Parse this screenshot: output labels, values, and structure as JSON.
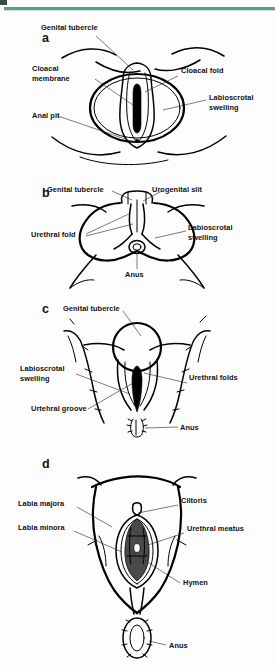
{
  "figure": {
    "accent_color": "#5a9e84",
    "ink_color": "#000000",
    "background_color": "#ffffff"
  },
  "panels": [
    {
      "letter": "a",
      "name": "indifferent-stage-cloacal",
      "labels": [
        {
          "key": "genital_tubercle",
          "text": "Genital tubercle"
        },
        {
          "key": "cloacal_membrane_l1",
          "text": "Cloacal"
        },
        {
          "key": "cloacal_membrane_l2",
          "text": "membrane"
        },
        {
          "key": "anal_pit",
          "text": "Anal pit"
        },
        {
          "key": "cloacal_fold",
          "text": "Cloacal fold"
        },
        {
          "key": "labioscrotal_swelling_l1",
          "text": "Labioscrotal"
        },
        {
          "key": "labioscrotal_swelling_l2",
          "text": "swelling"
        }
      ]
    },
    {
      "letter": "b",
      "name": "indifferent-stage-urogenital",
      "labels": [
        {
          "key": "genital_tubercle",
          "text": "Genital tubercle"
        },
        {
          "key": "urogenital_slit",
          "text": "Urogenital slit"
        },
        {
          "key": "urethral_fold",
          "text": "Urethral fold"
        },
        {
          "key": "labioscrotal_swelling_l1",
          "text": "Labioscrotal"
        },
        {
          "key": "labioscrotal_swelling_l2",
          "text": "swelling"
        },
        {
          "key": "anus",
          "text": "Anus"
        }
      ]
    },
    {
      "letter": "c",
      "name": "developing-female-genitalia",
      "labels": [
        {
          "key": "genital_tubercle",
          "text": "Genital tubercle"
        },
        {
          "key": "labioscrotal_swelling_l1",
          "text": "Labioscrotal"
        },
        {
          "key": "labioscrotal_swelling_l2",
          "text": "swelling"
        },
        {
          "key": "urethral_groove",
          "text": "Urtehral groove"
        },
        {
          "key": "urethral_folds",
          "text": "Urethral folds"
        },
        {
          "key": "anus",
          "text": "Anus"
        }
      ]
    },
    {
      "letter": "d",
      "name": "mature-female-external-genitalia",
      "labels": [
        {
          "key": "labia_majora",
          "text": "Labia majora"
        },
        {
          "key": "labia_minora",
          "text": "Labia minora"
        },
        {
          "key": "clitoris",
          "text": "Clitoris"
        },
        {
          "key": "urethral_meatus",
          "text": "Urethral meatus"
        },
        {
          "key": "hymen",
          "text": "Hymen"
        },
        {
          "key": "anus",
          "text": "Anus"
        }
      ]
    }
  ]
}
